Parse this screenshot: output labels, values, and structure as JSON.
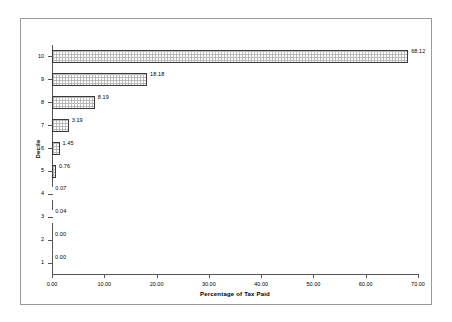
{
  "chart_data": {
    "type": "bar",
    "orientation": "horizontal",
    "title": "",
    "xlabel": "Percentage of Tax Paid",
    "ylabel": "Decile",
    "xlim": [
      0,
      70
    ],
    "xticks": [
      "0.00",
      "10.00",
      "20.00",
      "30.00",
      "40.00",
      "50.00",
      "60.00",
      "70.00"
    ],
    "xtick_values": [
      0,
      10,
      20,
      30,
      40,
      50,
      60,
      70
    ],
    "categories": [
      "1",
      "2",
      "3",
      "4",
      "5",
      "6",
      "7",
      "8",
      "9",
      "10"
    ],
    "values": [
      0.0,
      0.0,
      0.04,
      0.07,
      0.76,
      1.45,
      3.19,
      8.19,
      18.18,
      68.12
    ],
    "data_labels": [
      "0.00",
      "0.00",
      "0.04",
      "0.07",
      "0.76",
      "1.45",
      "3.19",
      "8.19",
      "18.18",
      "68.12"
    ],
    "grid": false,
    "legend": false,
    "bars": [
      {
        "category": "10",
        "value": 68.12,
        "label": "68.12"
      },
      {
        "category": "9",
        "value": 18.18,
        "label": "18.18"
      },
      {
        "category": "8",
        "value": 8.19,
        "label": "8.19"
      },
      {
        "category": "7",
        "value": 3.19,
        "label": "3.19"
      },
      {
        "category": "6",
        "value": 1.45,
        "label": "1.45"
      },
      {
        "category": "5",
        "value": 0.76,
        "label": "0.76"
      },
      {
        "category": "4",
        "value": 0.07,
        "label": "0.07"
      },
      {
        "category": "3",
        "value": 0.04,
        "label": "0.04"
      },
      {
        "category": "2",
        "value": 0.0,
        "label": "0.00"
      },
      {
        "category": "1",
        "value": 0.0,
        "label": "0.00"
      }
    ],
    "colors": {
      "bar_fill": "#ffffff",
      "bar_hatch": "#b9b9b9",
      "bar_border": "#3a3a3a",
      "axis": "#555555",
      "frame": "#9a9a9a",
      "text": "#000000",
      "background": "#ffffff"
    }
  }
}
